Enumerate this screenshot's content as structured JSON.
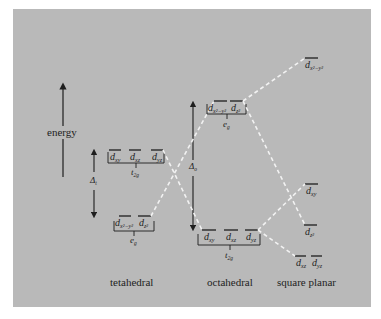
{
  "figure": {
    "axis_label": "energy",
    "background_color": "#b9b9b9",
    "line_color": "#1e1e1e",
    "correlation_line_color": "#f2f2f2"
  },
  "tetrahedral": {
    "title": "tetahedral",
    "splitting_label": "Δ",
    "splitting_sub": "t",
    "upper_group": {
      "label": "t",
      "sub": "2g",
      "orbitals": [
        {
          "base": "d",
          "sub": "xy"
        },
        {
          "base": "d",
          "sub": "xz"
        },
        {
          "base": "d",
          "sub": "yz"
        }
      ]
    },
    "lower_group": {
      "label": "e",
      "sub": "g",
      "orbitals": [
        {
          "base": "d",
          "sub": "x²−y²"
        },
        {
          "base": "d",
          "sub": "z²"
        }
      ]
    }
  },
  "octahedral": {
    "title": "octahedral",
    "splitting_label": "Δ",
    "splitting_sub": "o",
    "upper_group": {
      "label": "e",
      "sub": "g",
      "orbitals": [
        {
          "base": "d",
          "sub": "x²−y²"
        },
        {
          "base": "d",
          "sub": "z²"
        }
      ]
    },
    "lower_group": {
      "label": "t",
      "sub": "2g",
      "orbitals": [
        {
          "base": "d",
          "sub": "xy"
        },
        {
          "base": "d",
          "sub": "xz"
        },
        {
          "base": "d",
          "sub": "yz"
        }
      ]
    }
  },
  "square_planar": {
    "title": "square planar",
    "levels": [
      {
        "base": "d",
        "sub": "x²−y²"
      },
      {
        "base": "d",
        "sub": "xy"
      },
      {
        "base": "d",
        "sub": "z²"
      },
      {
        "base": "d",
        "sub": "xz"
      },
      {
        "base": "d",
        "sub": "yz"
      }
    ]
  }
}
